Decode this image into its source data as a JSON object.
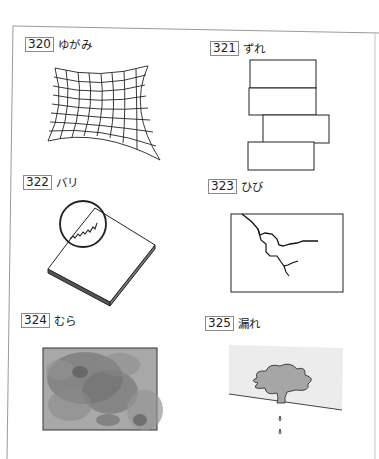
{
  "page": {
    "items": [
      {
        "number": "320",
        "term": "ゆがみ",
        "illustration": "warped-grid"
      },
      {
        "number": "321",
        "term": "ずれ",
        "illustration": "offset-stacked-blocks"
      },
      {
        "number": "322",
        "term": "バリ",
        "illustration": "slab-with-burr-magnified"
      },
      {
        "number": "323",
        "term": "ひび",
        "illustration": "cracked-panel"
      },
      {
        "number": "324",
        "term": "むら",
        "illustration": "uneven-blotchy-panel"
      },
      {
        "number": "325",
        "term": "漏れ",
        "illustration": "leak-puddle-with-drops"
      }
    ]
  },
  "colors": {
    "line": "#222222",
    "border": "#9a9a9a",
    "mura_dark": "#6e6e6e",
    "mura_light": "#a9a9a9",
    "leak_wall": "#ececec",
    "leak_puddle": "#a6a6a6"
  }
}
